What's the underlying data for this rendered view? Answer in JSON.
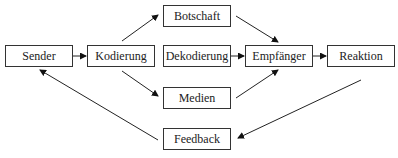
{
  "diagram": {
    "type": "flowchart",
    "nodes": [
      {
        "id": "sender",
        "label": "Sender"
      },
      {
        "id": "kodierung",
        "label": "Kodierung"
      },
      {
        "id": "botschaft",
        "label": "Botschaft"
      },
      {
        "id": "dekodierung",
        "label": "Dekodierung"
      },
      {
        "id": "medien",
        "label": "Medien"
      },
      {
        "id": "empfaenger",
        "label": "Empfänger"
      },
      {
        "id": "reaktion",
        "label": "Reaktion"
      },
      {
        "id": "feedback",
        "label": "Feedback"
      }
    ],
    "edges": [
      {
        "from": "sender",
        "to": "kodierung"
      },
      {
        "from": "kodierung",
        "to": "botschaft"
      },
      {
        "from": "kodierung",
        "to": "medien"
      },
      {
        "from": "botschaft",
        "to": "empfaenger"
      },
      {
        "from": "dekodierung",
        "to": "empfaenger"
      },
      {
        "from": "medien",
        "to": "empfaenger"
      },
      {
        "from": "empfaenger",
        "to": "reaktion"
      },
      {
        "from": "reaktion",
        "to": "feedback"
      },
      {
        "from": "feedback",
        "to": "sender"
      }
    ]
  }
}
